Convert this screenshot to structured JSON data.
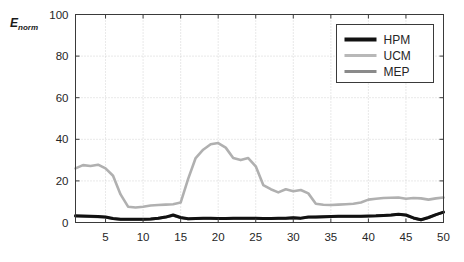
{
  "chart_data": {
    "type": "line",
    "title": "",
    "xlabel": "",
    "ylabel": "E_norm",
    "ylabel_base": "E",
    "ylabel_sub": "norm",
    "xlim": [
      1,
      50
    ],
    "ylim": [
      0,
      100
    ],
    "xticks": [
      5,
      10,
      15,
      20,
      25,
      30,
      35,
      40,
      45,
      50
    ],
    "yticks": [
      0,
      20,
      40,
      60,
      80,
      100
    ],
    "grid": true,
    "grid_style": "dotted",
    "legend_position": "top-right",
    "x": [
      1,
      2,
      3,
      4,
      5,
      6,
      7,
      8,
      9,
      10,
      11,
      12,
      13,
      14,
      15,
      16,
      17,
      18,
      19,
      20,
      21,
      22,
      23,
      24,
      25,
      26,
      27,
      28,
      29,
      30,
      31,
      32,
      33,
      34,
      35,
      36,
      37,
      38,
      39,
      40,
      41,
      42,
      43,
      44,
      45,
      46,
      47,
      48,
      49,
      50
    ],
    "series": [
      {
        "name": "HPM",
        "color": "#111111",
        "width": 3.0,
        "values": [
          3.2,
          3.1,
          3.0,
          2.9,
          2.6,
          1.9,
          1.6,
          1.6,
          1.6,
          1.6,
          1.7,
          2.0,
          2.6,
          3.6,
          2.4,
          1.8,
          1.9,
          2.0,
          2.0,
          1.9,
          1.9,
          2.0,
          2.0,
          2.0,
          2.0,
          1.9,
          1.9,
          2.0,
          2.1,
          2.3,
          2.1,
          2.6,
          2.7,
          2.8,
          2.9,
          3.0,
          3.0,
          3.0,
          3.0,
          3.1,
          3.2,
          3.4,
          3.6,
          4.0,
          3.6,
          2.2,
          1.3,
          2.4,
          3.8,
          5.0
        ]
      },
      {
        "name": "UCM",
        "color": "#b0b0b0",
        "width": 2.6,
        "values": [
          26.0,
          27.6,
          27.2,
          27.8,
          26.0,
          22.5,
          13.5,
          7.6,
          7.2,
          7.6,
          8.2,
          8.4,
          8.6,
          8.8,
          9.6,
          21.0,
          31.0,
          35.0,
          37.6,
          38.2,
          36.0,
          31.0,
          30.0,
          31.0,
          27.0,
          18.0,
          16.0,
          14.5,
          16.0,
          15.0,
          15.6,
          14.0,
          9.0,
          8.5,
          8.4,
          8.6,
          8.8,
          9.0,
          9.6,
          11.0,
          11.4,
          11.8,
          11.9,
          12.0,
          11.4,
          11.8,
          11.6,
          11.0,
          11.6,
          12.0
        ]
      },
      {
        "name": "MEP",
        "color": "#777777",
        "width": 2.6,
        "values": [
          3.0,
          2.9,
          2.8,
          2.7,
          2.5,
          1.8,
          1.5,
          1.5,
          1.5,
          1.5,
          1.6,
          1.9,
          2.5,
          3.4,
          2.3,
          1.7,
          1.8,
          1.9,
          1.9,
          1.8,
          1.8,
          1.9,
          1.9,
          1.9,
          1.9,
          1.8,
          1.8,
          1.9,
          2.0,
          2.2,
          2.0,
          2.5,
          2.6,
          2.7,
          2.8,
          2.9,
          2.9,
          2.9,
          2.9,
          3.0,
          3.1,
          3.3,
          3.5,
          3.9,
          3.5,
          2.1,
          1.2,
          2.3,
          3.7,
          4.9
        ]
      }
    ],
    "legend": [
      {
        "label": "HPM",
        "color": "#111111",
        "width": 4.0
      },
      {
        "label": "UCM",
        "color": "#b8b8b8",
        "width": 3.0
      },
      {
        "label": "MEP",
        "color": "#8a8a8a",
        "width": 3.2
      }
    ]
  },
  "axes": {
    "frame_color": "#3a3a3a",
    "grid_color": "#c8c8c8",
    "background": "#ffffff"
  }
}
